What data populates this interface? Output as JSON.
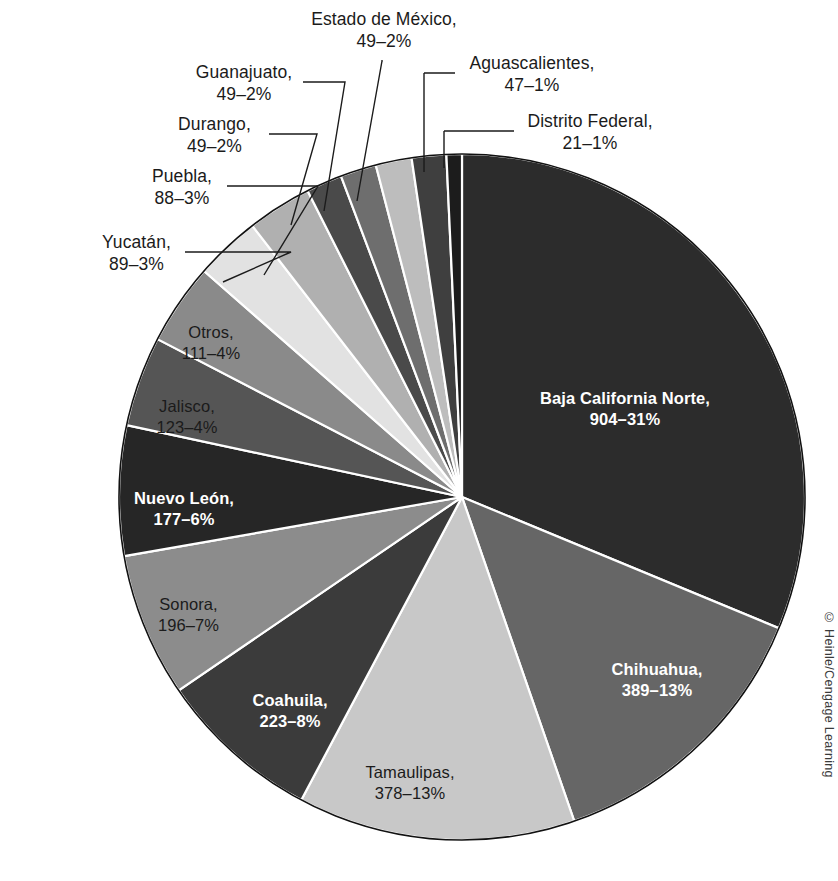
{
  "chart_data": {
    "type": "pie",
    "title": "",
    "unit_note": "value–percent",
    "start_angle_deg": 0,
    "direction": "clockwise",
    "center": {
      "x": 462,
      "y": 497
    },
    "radius": 343,
    "total": 2893,
    "categories": [
      "Baja California Norte",
      "Chihuahua",
      "Tamaulipas",
      "Coahuila",
      "Sonora",
      "Nuevo León",
      "Jalisco",
      "Otros",
      "Yucatán",
      "Puebla",
      "Durango",
      "Guanajuato",
      "Estado de México",
      "Aguascalientes",
      "Distrito Federal"
    ],
    "values": [
      904,
      389,
      378,
      223,
      196,
      177,
      123,
      111,
      89,
      88,
      49,
      49,
      49,
      47,
      21
    ],
    "percents": [
      31,
      13,
      13,
      8,
      7,
      6,
      4,
      4,
      3,
      3,
      2,
      2,
      2,
      1,
      1
    ],
    "slices": [
      {
        "name": "Baja California Norte",
        "value": 904,
        "percent": 31,
        "label_line1": "Baja California Norte,",
        "label_line2": "904–31%",
        "color": "#2c2c2c",
        "label_placement": "inside",
        "label_style": "dark"
      },
      {
        "name": "Chihuahua",
        "value": 389,
        "percent": 13,
        "label_line1": "Chihuahua,",
        "label_line2": "389–13%",
        "color": "#666666",
        "label_placement": "inside",
        "label_style": "dark"
      },
      {
        "name": "Tamaulipas",
        "value": 378,
        "percent": 13,
        "label_line1": "Tamaulipas,",
        "label_line2": "378–13%",
        "color": "#c8c8c8",
        "label_placement": "inside",
        "label_style": "light"
      },
      {
        "name": "Coahuila",
        "value": 223,
        "percent": 8,
        "label_line1": "Coahuila,",
        "label_line2": "223–8%",
        "color": "#3b3b3b",
        "label_placement": "inside",
        "label_style": "dark"
      },
      {
        "name": "Sonora",
        "value": 196,
        "percent": 7,
        "label_line1": "Sonora,",
        "label_line2": "196–7%",
        "color": "#8c8c8c",
        "label_placement": "inside",
        "label_style": "light"
      },
      {
        "name": "Nuevo León",
        "value": 177,
        "percent": 6,
        "label_line1": "Nuevo León,",
        "label_line2": "177–6%",
        "color": "#262626",
        "label_placement": "inside",
        "label_style": "dark"
      },
      {
        "name": "Jalisco",
        "value": 123,
        "percent": 4,
        "label_line1": "Jalisco,",
        "label_line2": "123–4%",
        "color": "#555555",
        "label_placement": "inside",
        "label_style": "light"
      },
      {
        "name": "Otros",
        "value": 111,
        "percent": 4,
        "label_line1": "Otros,",
        "label_line2": "111–4%",
        "color": "#8a8a8a",
        "label_placement": "inside",
        "label_style": "light"
      },
      {
        "name": "Yucatán",
        "value": 89,
        "percent": 3,
        "label_line1": "Yucatán,",
        "label_line2": "89–3%",
        "color": "#e2e2e2",
        "label_placement": "callout",
        "label_style": "light"
      },
      {
        "name": "Puebla",
        "value": 88,
        "percent": 3,
        "label_line1": "Puebla,",
        "label_line2": "88–3%",
        "color": "#b0b0b0",
        "label_placement": "callout",
        "label_style": "light"
      },
      {
        "name": "Durango",
        "value": 49,
        "percent": 2,
        "label_line1": "Durango,",
        "label_line2": "49–2%",
        "color": "#4a4a4a",
        "label_placement": "callout",
        "label_style": "light"
      },
      {
        "name": "Guanajuato",
        "value": 49,
        "percent": 2,
        "label_line1": "Guanajuato,",
        "label_line2": "49–2%",
        "color": "#6e6e6e",
        "label_placement": "callout",
        "label_style": "light"
      },
      {
        "name": "Estado de México",
        "value": 49,
        "percent": 2,
        "label_line1": "Estado de México,",
        "label_line2": "49–2%",
        "color": "#bdbdbd",
        "label_placement": "callout",
        "label_style": "light"
      },
      {
        "name": "Aguascalientes",
        "value": 47,
        "percent": 1,
        "label_line1": "Aguascalientes,",
        "label_line2": "47–1%",
        "color": "#3f3f3f",
        "label_placement": "callout",
        "label_style": "light"
      },
      {
        "name": "Distrito Federal",
        "value": 21,
        "percent": 1,
        "label_line1": "Distrito Federal,",
        "label_line2": "21–1%",
        "color": "#1c1c1c",
        "label_placement": "callout",
        "label_style": "light"
      }
    ],
    "legend": "none",
    "grid": false
  },
  "callouts": {
    "estado_de_mexico": {
      "line1": "Estado de México,",
      "line2": "49–2%"
    },
    "guanajuato": {
      "line1": "Guanajuato,",
      "line2": "49–2%"
    },
    "durango": {
      "line1": "Durango,",
      "line2": "49–2%"
    },
    "puebla": {
      "line1": "Puebla,",
      "line2": "88–3%"
    },
    "yucatan": {
      "line1": "Yucatán,",
      "line2": "89–3%"
    },
    "aguascalientes": {
      "line1": "Aguascalientes,",
      "line2": "47–1%"
    },
    "distrito_federal": {
      "line1": "Distrito Federal,",
      "line2": "21–1%"
    }
  },
  "inside_labels": {
    "baja_california_norte": {
      "line1": "Baja California Norte,",
      "line2": "904–31%"
    },
    "chihuahua": {
      "line1": "Chihuahua,",
      "line2": "389–13%"
    },
    "tamaulipas": {
      "line1": "Tamaulipas,",
      "line2": "378–13%"
    },
    "coahuila": {
      "line1": "Coahuila,",
      "line2": "223–8%"
    },
    "sonora": {
      "line1": "Sonora,",
      "line2": "196–7%"
    },
    "nuevo_leon": {
      "line1": "Nuevo León,",
      "line2": "177–6%"
    },
    "jalisco": {
      "line1": "Jalisco,",
      "line2": "123–4%"
    },
    "otros": {
      "line1": "Otros,",
      "line2": "111–4%"
    }
  },
  "copyright": "© Heinle/Cengage Learning",
  "caption": ""
}
